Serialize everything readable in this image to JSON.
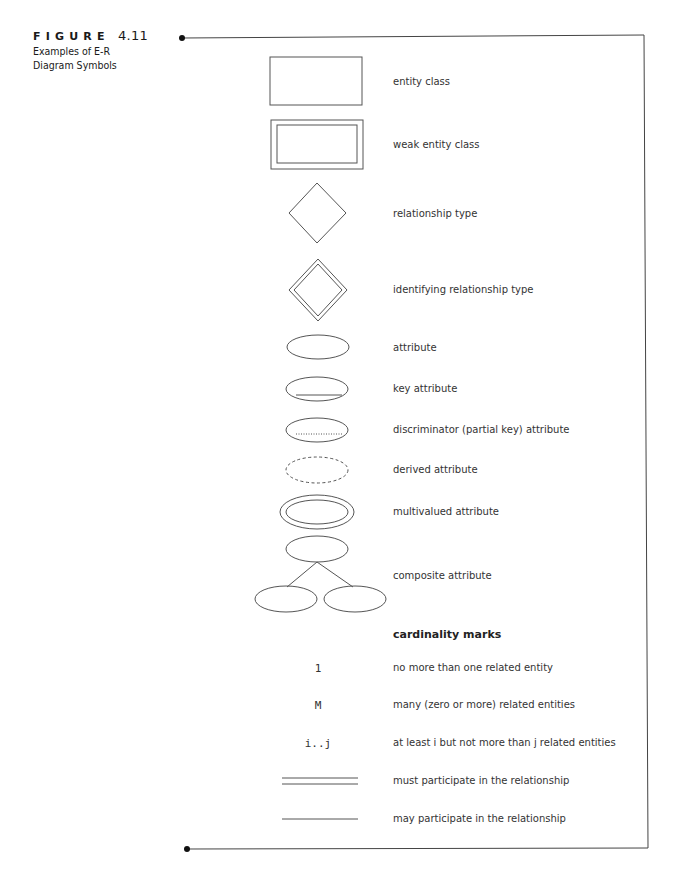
{
  "figure": {
    "label": "FIGURE",
    "number": "4.11",
    "caption": "Examples of E-R Diagram Symbols"
  },
  "symbols": [
    {
      "shape": "rectangle",
      "label": "entity class"
    },
    {
      "shape": "double-rectangle",
      "label": "weak entity class"
    },
    {
      "shape": "diamond",
      "label": "relationship type"
    },
    {
      "shape": "double-diamond",
      "label": "identifying relationship type"
    },
    {
      "shape": "ellipse",
      "label": "attribute"
    },
    {
      "shape": "ellipse-solid-underline",
      "label": "key attribute"
    },
    {
      "shape": "ellipse-dotted-underline",
      "label": "discriminator (partial key) attribute"
    },
    {
      "shape": "dashed-ellipse",
      "label": "derived attribute"
    },
    {
      "shape": "double-ellipse",
      "label": "multivalued attribute"
    },
    {
      "shape": "ellipse-tree",
      "label": "composite attribute"
    }
  ],
  "cardinality": {
    "heading": "cardinality marks",
    "items": [
      {
        "mark": "1",
        "label": "no more than one related entity"
      },
      {
        "mark": "M",
        "label": "many (zero or more) related entities"
      },
      {
        "mark": "i..j",
        "label": "at least i but not more than j related entities"
      },
      {
        "mark": "double-line",
        "label": "must participate in the relationship"
      },
      {
        "mark": "single-line",
        "label": "may participate in the relationship"
      }
    ]
  },
  "colors": {
    "stroke": "#555555",
    "text": "#333333",
    "frame": "#444444"
  }
}
